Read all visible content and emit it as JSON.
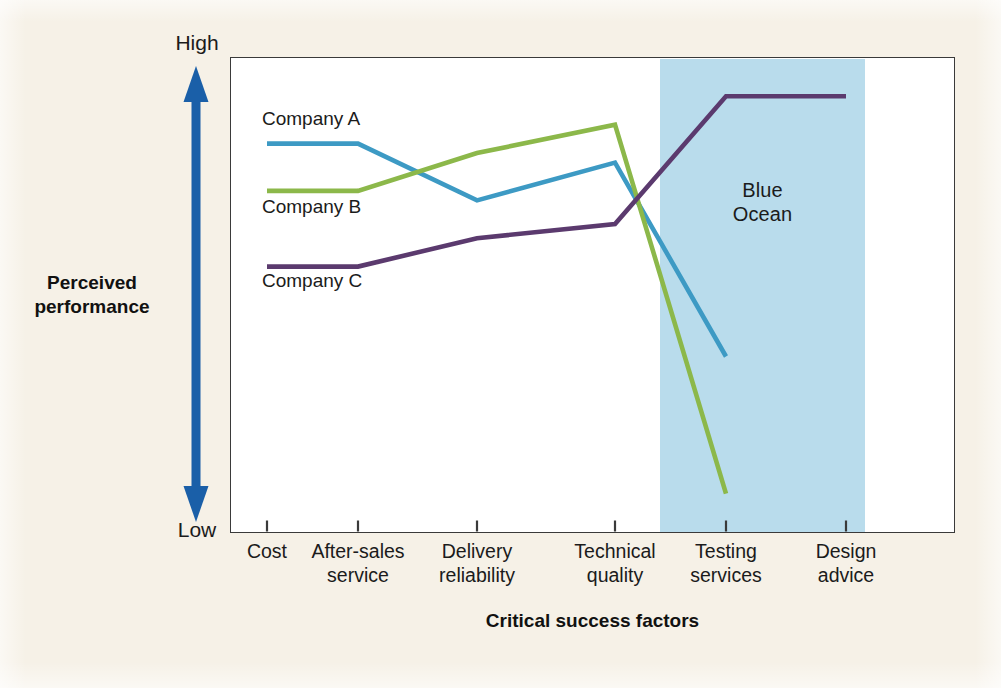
{
  "figure": {
    "background_color": "#f6f1e7",
    "plot_background": "#ffffff",
    "border_color": "#3a3a3a"
  },
  "yaxis": {
    "high_label": "High",
    "low_label": "Low",
    "title_line1": "Perceived",
    "title_line2": "performance",
    "arrow_color": "#1a5fa8",
    "arrow_style": "double-headed-vertical"
  },
  "xaxis": {
    "title": "Critical success factors"
  },
  "highlight": {
    "label_line1": "Blue",
    "label_line2": "Ocean",
    "color": "#b9dcec",
    "covers": [
      "Testing services",
      "Design advice"
    ]
  },
  "series_labels": [
    {
      "name": "Company A",
      "color": "#3d9ac4"
    },
    {
      "name": "Company B",
      "color": "#8cb84a"
    },
    {
      "name": "Company C",
      "color": "#5b3a6e"
    }
  ],
  "chart_data": {
    "type": "line",
    "title": "",
    "xlabel": "Critical success factors",
    "ylabel": "Perceived performance",
    "ylim": [
      0,
      100
    ],
    "ytick_labels": [
      "Low",
      "High"
    ],
    "grid": false,
    "legend": "inline-labels-left",
    "categories": [
      "Cost",
      "After-sales service",
      "Delivery reliability",
      "Technical quality",
      "Testing services",
      "Design advice"
    ],
    "category_lines": [
      [
        "Cost"
      ],
      [
        "After-sales",
        "service"
      ],
      [
        "Delivery",
        "reliability"
      ],
      [
        "Technical",
        "quality"
      ],
      [
        "Testing",
        "services"
      ],
      [
        "Design",
        "advice"
      ]
    ],
    "series": [
      {
        "name": "Company A",
        "color": "#3d9ac4",
        "values": [
          82,
          82,
          70,
          78,
          37,
          null
        ]
      },
      {
        "name": "Company B",
        "color": "#8cb84a",
        "values": [
          72,
          72,
          80,
          86,
          8,
          null
        ]
      },
      {
        "name": "Company C",
        "color": "#5b3a6e",
        "values": [
          56,
          56,
          62,
          65,
          92,
          92
        ]
      }
    ],
    "annotations": [
      {
        "text": "Blue Ocean",
        "region": "Testing services to Design advice"
      }
    ]
  }
}
